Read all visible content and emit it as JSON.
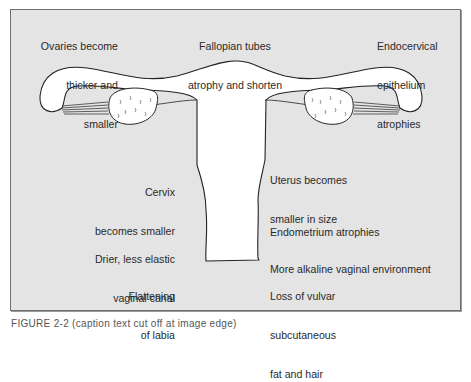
{
  "diagram": {
    "type": "anatomical-illustration",
    "colors": {
      "background": "#e4e4e4",
      "frame_border": "#6e6e6e",
      "organ_fill": "#ffffff",
      "outline": "#222222",
      "text": "#2a2a2a"
    },
    "labels": {
      "ovaries": [
        "Ovaries become",
        "thicker and",
        "smaller"
      ],
      "fallopian": [
        "Fallopian tubes",
        "atrophy and shorten"
      ],
      "endocervical": [
        "Endocervical",
        "epithelium",
        "atrophies"
      ],
      "cervix": [
        "Cervix",
        "becomes smaller"
      ],
      "uterus": [
        "Uterus becomes",
        "smaller in size"
      ],
      "endometrium": [
        "Endometrium atrophies"
      ],
      "vaginal_canal": [
        "Drier, less elastic",
        "vaginal canal"
      ],
      "alkaline": [
        "More alkaline vaginal environment"
      ],
      "labia": [
        "Flattening",
        "of labia"
      ],
      "vulvar": [
        "Loss of vulvar",
        "subcutaneous",
        "fat and hair"
      ]
    },
    "caption": "FIGURE 2-2  (caption text cut off at image edge)"
  }
}
